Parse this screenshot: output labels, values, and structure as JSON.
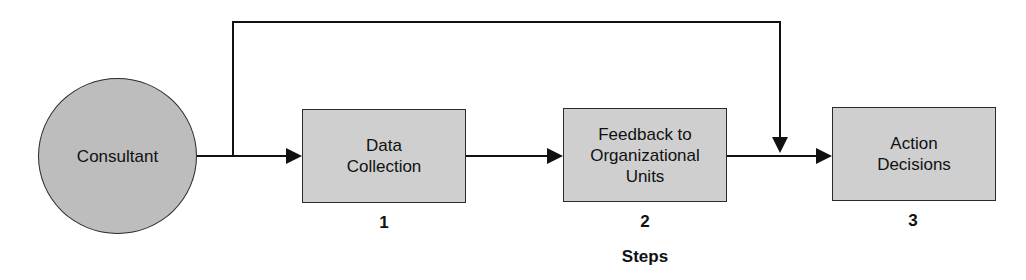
{
  "diagram": {
    "source": {
      "label": "Consultant"
    },
    "steps": [
      {
        "label": "Data Collection",
        "lines": [
          "Data",
          "Collection"
        ],
        "number": "1"
      },
      {
        "label": "Feedback to Organizational Units",
        "lines": [
          "Feedback to",
          "Organizational",
          "Units"
        ],
        "number": "2"
      },
      {
        "label": "Action Decisions",
        "lines": [
          "Action",
          "Decisions"
        ],
        "number": "3"
      }
    ],
    "axis_label": "Steps",
    "colors": {
      "circle_fill": "#bdbdbd",
      "box_fill": "#cfcfcf",
      "line": "#111111"
    }
  }
}
